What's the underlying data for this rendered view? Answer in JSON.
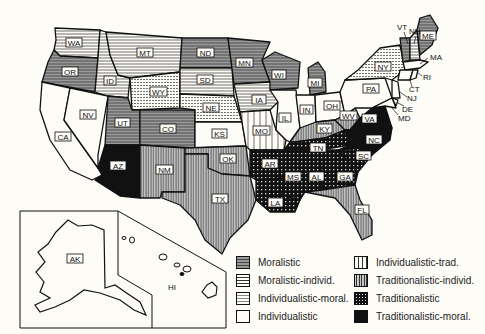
{
  "map": {
    "title": "Political cultures of the United States",
    "states": [
      {
        "abbr": "WA",
        "culture": "Moralistic-individ."
      },
      {
        "abbr": "OR",
        "culture": "Moralistic"
      },
      {
        "abbr": "CA",
        "culture": "Individualistic"
      },
      {
        "abbr": "NV",
        "culture": "Individualistic"
      },
      {
        "abbr": "ID",
        "culture": "Moralistic-individ."
      },
      {
        "abbr": "MT",
        "culture": "Moralistic-individ."
      },
      {
        "abbr": "WY",
        "culture": "Individualistic-moral."
      },
      {
        "abbr": "UT",
        "culture": "Moralistic"
      },
      {
        "abbr": "CO",
        "culture": "Moralistic"
      },
      {
        "abbr": "AZ",
        "culture": "Traditionalistic-moral."
      },
      {
        "abbr": "NM",
        "culture": "Traditionalistic-individ."
      },
      {
        "abbr": "ND",
        "culture": "Moralistic"
      },
      {
        "abbr": "SD",
        "culture": "Moralistic-individ."
      },
      {
        "abbr": "NE",
        "culture": "Individualistic-moral."
      },
      {
        "abbr": "KS",
        "culture": "Individualistic"
      },
      {
        "abbr": "OK",
        "culture": "Traditionalistic-individ."
      },
      {
        "abbr": "TX",
        "culture": "Traditionalistic-individ."
      },
      {
        "abbr": "MN",
        "culture": "Moralistic"
      },
      {
        "abbr": "IA",
        "culture": "Moralistic-individ."
      },
      {
        "abbr": "MO",
        "culture": "Individualistic-trad."
      },
      {
        "abbr": "AR",
        "culture": "Traditionalistic"
      },
      {
        "abbr": "LA",
        "culture": "Traditionalistic"
      },
      {
        "abbr": "WI",
        "culture": "Moralistic"
      },
      {
        "abbr": "IL",
        "culture": "Individualistic"
      },
      {
        "abbr": "MI",
        "culture": "Moralistic"
      },
      {
        "abbr": "IN",
        "culture": "Individualistic"
      },
      {
        "abbr": "OH",
        "culture": "Individualistic"
      },
      {
        "abbr": "KY",
        "culture": "Traditionalistic-individ."
      },
      {
        "abbr": "TN",
        "culture": "Traditionalistic"
      },
      {
        "abbr": "MS",
        "culture": "Traditionalistic"
      },
      {
        "abbr": "AL",
        "culture": "Traditionalistic"
      },
      {
        "abbr": "GA",
        "culture": "Traditionalistic"
      },
      {
        "abbr": "FL",
        "culture": "Traditionalistic-individ."
      },
      {
        "abbr": "SC",
        "culture": "Traditionalistic"
      },
      {
        "abbr": "NC",
        "culture": "Traditionalistic-moral."
      },
      {
        "abbr": "VA",
        "culture": "Traditionalistic-moral."
      },
      {
        "abbr": "WV",
        "culture": "Traditionalistic-individ."
      },
      {
        "abbr": "PA",
        "culture": "Individualistic"
      },
      {
        "abbr": "NY",
        "culture": "Individualistic-moral."
      },
      {
        "abbr": "VT",
        "culture": "Moralistic"
      },
      {
        "abbr": "NH",
        "culture": "Moralistic-individ."
      },
      {
        "abbr": "ME",
        "culture": "Moralistic"
      },
      {
        "abbr": "MA",
        "culture": "Individualistic"
      },
      {
        "abbr": "RI",
        "culture": "Individualistic"
      },
      {
        "abbr": "CT",
        "culture": "Individualistic"
      },
      {
        "abbr": "NJ",
        "culture": "Individualistic"
      },
      {
        "abbr": "DE",
        "culture": "Individualistic"
      },
      {
        "abbr": "MD",
        "culture": "Individualistic"
      },
      {
        "abbr": "AK",
        "culture": "Individualistic"
      },
      {
        "abbr": "HI",
        "culture": "Individualistic"
      }
    ],
    "labels": {
      "WA": "WA",
      "OR": "OR",
      "CA": "CA",
      "NV": "NV",
      "ID": "ID",
      "MT": "MT",
      "WY": "WY",
      "UT": "UT",
      "CO": "CO",
      "AZ": "AZ",
      "NM": "NM",
      "ND": "ND",
      "SD": "SD",
      "NE": "NE",
      "KS": "KS",
      "OK": "OK",
      "TX": "TX",
      "MN": "MN",
      "IA": "IA",
      "MO": "MO",
      "AR": "AR",
      "LA": "LA",
      "WI": "WI",
      "IL": "IL",
      "MI": "MI",
      "IN": "IN",
      "OH": "OH",
      "KY": "KY",
      "TN": "TN",
      "MS": "MS",
      "AL": "AL",
      "GA": "GA",
      "FL": "FL",
      "SC": "SC",
      "NC": "NC",
      "VA": "VA",
      "WV": "WV",
      "PA": "PA",
      "NY": "NY",
      "VT": "VT",
      "NH": "NH",
      "ME": "ME",
      "MA": "MA",
      "RI": "RI",
      "CT": "CT",
      "NJ": "NJ",
      "DE": "DE",
      "MD": "MD",
      "AK": "AK",
      "HI": "HI"
    }
  },
  "legend": {
    "items": [
      {
        "label": "Moralistic",
        "pattern": "dense-horizontal-shaded"
      },
      {
        "label": "Moralistic-individ.",
        "pattern": "horizontal-lines"
      },
      {
        "label": "Individualistic-moral.",
        "pattern": "dotted-horizontal"
      },
      {
        "label": "Individualistic",
        "pattern": "blank"
      },
      {
        "label": "Individualistic-trad.",
        "pattern": "sparse-vertical"
      },
      {
        "label": "Traditionalistic-individ.",
        "pattern": "dense-vertical"
      },
      {
        "label": "Traditionalistic",
        "pattern": "black-dotted"
      },
      {
        "label": "Traditionalistic-moral.",
        "pattern": "solid-black"
      }
    ]
  },
  "colors": {
    "background": "#fdfcf7",
    "ink": "#111111",
    "shade": "#8a8a8a"
  }
}
